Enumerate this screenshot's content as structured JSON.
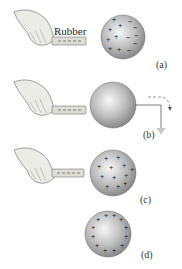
{
  "figure": {
    "title_label": "Rubber",
    "panels": [
      {
        "id": "a",
        "label": "(a)",
        "description": "Charged rubber rod near neutral sphere; charges separate (+ near rod, − far side)",
        "rod_charge": "− − −",
        "sphere_plus": [
          "+",
          "+",
          "+",
          "+",
          "+",
          "+",
          "+"
        ],
        "sphere_minus": [
          "−",
          "−",
          "−",
          "−",
          "−",
          "−"
        ]
      },
      {
        "id": "b",
        "label": "(b)",
        "description": "Sphere grounded; electrons flow to ground",
        "rod_charge": "− − −",
        "ground_flow_symbol": "− −"
      },
      {
        "id": "c",
        "label": "(c)",
        "description": "Ground removed; sphere left with net positive charge",
        "rod_charge": "− − −",
        "sphere_plus": [
          "+",
          "+",
          "+",
          "+",
          "+",
          "+",
          "+",
          "+",
          "+",
          "+",
          "+",
          "+"
        ]
      },
      {
        "id": "d",
        "label": "(d)",
        "description": "Rod removed; positive charge distributes uniformly on surface",
        "sphere_plus": [
          "+",
          "+",
          "+",
          "+",
          "+",
          "+",
          "+",
          "+",
          "+",
          "+",
          "+",
          "+"
        ]
      }
    ]
  },
  "colors": {
    "sphere_light": "#f2f2f2",
    "sphere_dark": "#8a8a8a",
    "rod": "#d8d8d0",
    "hand": "#e8e8e2",
    "ink": "#333333"
  }
}
